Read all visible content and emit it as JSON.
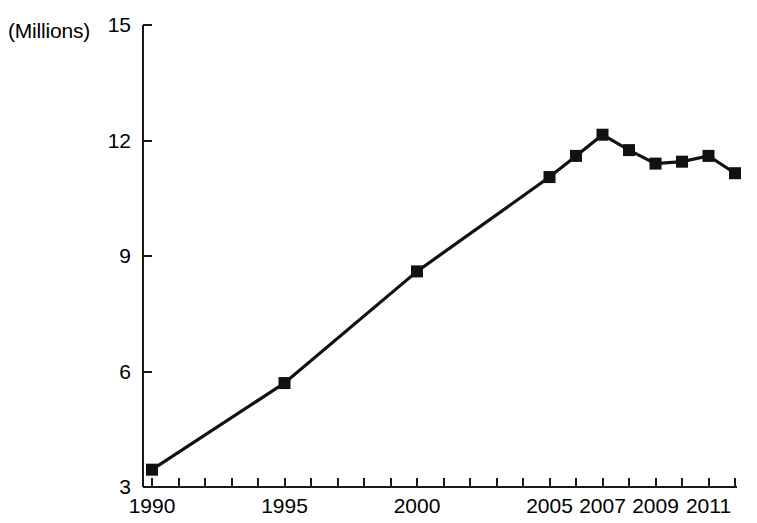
{
  "chart_data": {
    "type": "line",
    "title": "",
    "subtitle": "",
    "unit_label": "(Millions)",
    "xlabel": "",
    "ylabel": "",
    "ylim": [
      3,
      15
    ],
    "xlim": [
      1990,
      2012
    ],
    "y_ticks": [
      3,
      6,
      9,
      12,
      15
    ],
    "y_tick_labels": [
      "3",
      "6",
      "9",
      "12",
      "15"
    ],
    "x_ticks": [
      1990,
      1991,
      1992,
      1993,
      1994,
      1995,
      1996,
      1997,
      1998,
      1999,
      2000,
      2001,
      2002,
      2003,
      2004,
      2005,
      2006,
      2007,
      2008,
      2009,
      2010,
      2011,
      2012
    ],
    "x_tick_labels": [
      "1990",
      "",
      "",
      "",
      "",
      "1995",
      "",
      "",
      "",
      "",
      "2000",
      "",
      "",
      "",
      "",
      "2005",
      "",
      "2007",
      "",
      "2009",
      "",
      "2011",
      ""
    ],
    "grid": false,
    "legend": false,
    "legend_position": "none",
    "marker": "square",
    "line_color": "#111111",
    "marker_color": "#111111",
    "axis_color": "#1a1a1a",
    "background_color": "#ffffff",
    "x": [
      1990,
      1995,
      2000,
      2005,
      2006,
      2007,
      2008,
      2009,
      2010,
      2011,
      2012
    ],
    "values": [
      3.45,
      5.7,
      8.6,
      11.05,
      11.6,
      12.15,
      11.75,
      11.4,
      11.45,
      11.6,
      11.15
    ],
    "series": [
      {
        "name": "",
        "x": [
          1990,
          1995,
          2000,
          2005,
          2006,
          2007,
          2008,
          2009,
          2010,
          2011,
          2012
        ],
        "values": [
          3.45,
          5.7,
          8.6,
          11.05,
          11.6,
          12.15,
          11.75,
          11.4,
          11.45,
          11.6,
          11.15
        ]
      }
    ],
    "annotations": []
  }
}
